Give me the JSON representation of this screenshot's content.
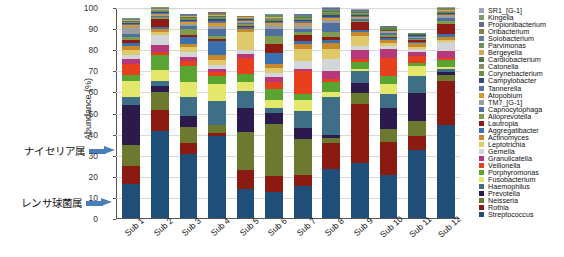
{
  "chart_data": {
    "type": "bar",
    "stacked": true,
    "title": "",
    "xlabel": "",
    "ylabel": "Abundance (%)",
    "ylim": [
      0,
      100
    ],
    "yticks": [
      0,
      10,
      20,
      30,
      40,
      50,
      60,
      70,
      80,
      90,
      100
    ],
    "grid": true,
    "legend_position": "right",
    "categories": [
      "Sub 1",
      "Sub 2",
      "Sub 3",
      "Sub 4",
      "Sub 5",
      "Sub 6",
      "Sub 7",
      "Sub 8",
      "Sub 9",
      "Sub 10",
      "Sub 11",
      "Sub 12"
    ],
    "totals": [
      95,
      100,
      97,
      98,
      96,
      97,
      97,
      100,
      99,
      91,
      88,
      100
    ],
    "series": [
      {
        "name": "Streptococcus",
        "color": "#1f4e79",
        "values": [
          16.0,
          43.5,
          30.0,
          36.0,
          14.0,
          11.0,
          14.5,
          22.0,
          28.0,
          21.0,
          36.5,
          44.0
        ]
      },
      {
        "name": "Rothia",
        "color": "#8b1a12",
        "values": [
          8.5,
          10.5,
          5.5,
          1.5,
          9.5,
          7.0,
          5.0,
          11.5,
          30.5,
          16.5,
          8.0,
          20.5
        ]
      },
      {
        "name": "Neisseria",
        "color": "#6b7a2e",
        "values": [
          10.0,
          9.0,
          7.5,
          3.5,
          18.0,
          22.0,
          16.0,
          2.5,
          5.5,
          6.5,
          8.0,
          3.0
        ]
      },
      {
        "name": "Prevotella",
        "color": "#2c1a4d",
        "values": [
          19.0,
          3.0,
          5.0,
          0.0,
          12.0,
          5.0,
          5.0,
          1.5,
          5.5,
          10.0,
          15.0,
          1.5
        ]
      },
      {
        "name": "Haemophilus",
        "color": "#3f6f86",
        "values": [
          4.0,
          2.5,
          9.0,
          10.5,
          8.0,
          2.0,
          8.0,
          17.0,
          6.0,
          7.0,
          9.0,
          1.5
        ]
      },
      {
        "name": "Fusobacterium",
        "color": "#e3e86a",
        "values": [
          7.5,
          5.5,
          7.0,
          7.5,
          4.5,
          3.5,
          5.0,
          2.0,
          1.0,
          5.0,
          5.5,
          0.8
        ]
      },
      {
        "name": "Porphyromonas",
        "color": "#59a432",
        "values": [
          3.0,
          7.5,
          7.5,
          3.5,
          4.0,
          4.5,
          2.5,
          4.5,
          3.5,
          4.0,
          1.5,
          3.5
        ]
      },
      {
        "name": "Veillonella",
        "color": "#e8401c",
        "values": [
          5.0,
          1.5,
          2.5,
          1.5,
          7.5,
          3.0,
          10.5,
          1.5,
          1.5,
          9.0,
          4.0,
          0.6
        ]
      },
      {
        "name": "Granulicatella",
        "color": "#b5397a",
        "values": [
          2.5,
          3.5,
          2.0,
          1.5,
          2.0,
          2.5,
          1.0,
          3.5,
          5.0,
          4.0,
          2.0,
          3.5
        ]
      },
      {
        "name": "Gemella",
        "color": "#d3d6d8",
        "values": [
          2.0,
          5.0,
          2.5,
          1.5,
          2.0,
          1.5,
          3.5,
          5.5,
          2.0,
          1.5,
          1.5,
          4.0
        ]
      },
      {
        "name": "Leptotrichia",
        "color": "#e0c96a",
        "values": [
          2.0,
          1.5,
          2.0,
          2.5,
          8.5,
          2.0,
          5.5,
          4.5,
          5.0,
          1.5,
          1.5,
          1.0
        ]
      },
      {
        "name": "Actinomyces",
        "color": "#c8892a",
        "values": [
          2.0,
          1.5,
          1.5,
          2.0,
          1.5,
          2.0,
          2.0,
          2.5,
          2.0,
          1.5,
          2.0,
          1.5
        ]
      },
      {
        "name": "Aggregatibacter",
        "color": "#3a6fb0",
        "values": [
          1.5,
          1.0,
          3.5,
          6.0,
          1.0,
          4.5,
          1.5,
          1.5,
          1.0,
          1.0,
          0.8,
          1.5
        ]
      },
      {
        "name": "Lautropia",
        "color": "#8e1c12",
        "values": [
          1.5,
          4.0,
          1.0,
          1.0,
          0.8,
          4.0,
          2.5,
          1.5,
          4.0,
          0.8,
          0.6,
          4.5
        ]
      },
      {
        "name": "Alloprevotella",
        "color": "#7f9b4e",
        "values": [
          1.5,
          1.0,
          2.5,
          1.5,
          0.8,
          3.5,
          1.5,
          2.0,
          0.8,
          0.8,
          0.6,
          1.5
        ]
      },
      {
        "name": "Capnocytophaga",
        "color": "#4f6f9e",
        "values": [
          1.2,
          0.8,
          1.5,
          3.0,
          0.6,
          3.0,
          1.5,
          4.0,
          0.8,
          0.8,
          0.6,
          1.5
        ]
      },
      {
        "name": "TM7_[G-1]",
        "color": "#9d9d9d",
        "values": [
          3.5,
          0.6,
          1.0,
          1.5,
          0.5,
          1.5,
          1.5,
          1.5,
          0.8,
          0.6,
          0.5,
          0.8
        ]
      },
      {
        "name": "Atopobium",
        "color": "#d99a2b",
        "values": [
          0.6,
          0.5,
          0.8,
          1.0,
          0.4,
          0.8,
          1.0,
          0.8,
          0.6,
          0.4,
          0.4,
          0.6
        ]
      },
      {
        "name": "Tannerella",
        "color": "#5b6fa8",
        "values": [
          0.5,
          0.5,
          0.6,
          1.0,
          0.4,
          0.6,
          0.8,
          0.8,
          0.5,
          0.4,
          0.3,
          0.6
        ]
      },
      {
        "name": "Campylobacter",
        "color": "#2f4f7a",
        "values": [
          0.5,
          0.4,
          0.6,
          0.8,
          0.3,
          0.6,
          0.6,
          0.8,
          0.5,
          0.3,
          0.3,
          0.5
        ]
      },
      {
        "name": "Corynebacterium",
        "color": "#6f8f3f",
        "values": [
          0.4,
          0.4,
          0.5,
          0.6,
          0.3,
          0.5,
          0.5,
          0.6,
          0.4,
          0.3,
          0.3,
          0.4
        ]
      },
      {
        "name": "Catonella",
        "color": "#8a8f6a",
        "values": [
          0.4,
          0.3,
          0.4,
          0.5,
          0.3,
          0.4,
          0.4,
          0.5,
          0.4,
          0.3,
          0.2,
          0.4
        ]
      },
      {
        "name": "Cardiobacterium",
        "color": "#4a7a4a",
        "values": [
          0.3,
          0.3,
          0.4,
          0.4,
          0.2,
          0.4,
          0.4,
          0.4,
          0.3,
          0.2,
          0.2,
          0.3
        ]
      },
      {
        "name": "Bergeyella",
        "color": "#d4a95a",
        "values": [
          0.3,
          0.3,
          0.3,
          0.4,
          0.2,
          0.3,
          0.3,
          0.4,
          0.3,
          0.2,
          0.2,
          0.3
        ]
      },
      {
        "name": "Parvimonas",
        "color": "#6a8f5a",
        "values": [
          0.3,
          0.2,
          0.3,
          0.3,
          0.2,
          0.3,
          0.3,
          0.3,
          0.3,
          0.2,
          0.2,
          0.3
        ]
      },
      {
        "name": "Solobacterium",
        "color": "#5f7fa5",
        "values": [
          0.2,
          0.2,
          0.3,
          0.3,
          0.2,
          0.3,
          0.3,
          0.3,
          0.2,
          0.2,
          0.1,
          0.2
        ]
      },
      {
        "name": "Oribacterium",
        "color": "#8e7a4a",
        "values": [
          0.2,
          0.2,
          0.2,
          0.3,
          0.2,
          0.2,
          0.2,
          0.3,
          0.2,
          0.2,
          0.1,
          0.2
        ]
      },
      {
        "name": "Propionibacterium",
        "color": "#6a6a8f",
        "values": [
          0.2,
          0.2,
          0.2,
          0.2,
          0.1,
          0.2,
          0.2,
          0.2,
          0.2,
          0.1,
          0.1,
          0.2
        ]
      },
      {
        "name": "Kingella",
        "color": "#7a9a6a",
        "values": [
          0.2,
          0.1,
          0.2,
          0.2,
          0.1,
          0.2,
          0.2,
          0.2,
          0.2,
          0.1,
          0.1,
          0.2
        ]
      },
      {
        "name": "SR1_[G-1]",
        "color": "#9aa6b5",
        "values": [
          0.2,
          0.1,
          0.2,
          0.2,
          0.1,
          0.2,
          0.2,
          0.2,
          0.2,
          0.1,
          0.1,
          0.2
        ]
      }
    ]
  },
  "legend": {
    "items": [
      {
        "label": "SR1_[G-1]",
        "color": "#9aa6b5"
      },
      {
        "label": "Kingella",
        "color": "#7a9a6a"
      },
      {
        "label": "Propionibacterium",
        "color": "#6a6a8f"
      },
      {
        "label": "Oribacterium",
        "color": "#8e7a4a"
      },
      {
        "label": "Solobacterium",
        "color": "#5f7fa5"
      },
      {
        "label": "Parvimonas",
        "color": "#6a8f5a"
      },
      {
        "label": "Bergeyella",
        "color": "#d4a95a"
      },
      {
        "label": "Cardiobacterium",
        "color": "#4a7a4a"
      },
      {
        "label": "Catonella",
        "color": "#8a8f6a"
      },
      {
        "label": "Corynebacterium",
        "color": "#6f8f3f"
      },
      {
        "label": "Campylobacter",
        "color": "#2f4f7a"
      },
      {
        "label": "Tannerella",
        "color": "#5b6fa8"
      },
      {
        "label": "Atopobium",
        "color": "#d99a2b"
      },
      {
        "label": "TM7_[G-1]",
        "color": "#9d9d9d"
      },
      {
        "label": "Capnocytophaga",
        "color": "#4f6f9e"
      },
      {
        "label": "Alloprevotella",
        "color": "#7f9b4e"
      },
      {
        "label": "Lautropia",
        "color": "#8e1c12"
      },
      {
        "label": "Aggregatibacter",
        "color": "#3a6fb0"
      },
      {
        "label": "Actinomyces",
        "color": "#c8892a"
      },
      {
        "label": "Leptotrichia",
        "color": "#e0c96a"
      },
      {
        "label": "Gemella",
        "color": "#d3d6d8"
      },
      {
        "label": "Granulicatella",
        "color": "#b5397a"
      },
      {
        "label": "Veillonella",
        "color": "#e8401c"
      },
      {
        "label": "Porphyromonas",
        "color": "#59a432"
      },
      {
        "label": "Fusobacterium",
        "color": "#e3e86a"
      },
      {
        "label": "Haemophilus",
        "color": "#3f6f86"
      },
      {
        "label": "Prevotella",
        "color": "#2c1a4d"
      },
      {
        "label": "Neisseria",
        "color": "#6b7a2e"
      },
      {
        "label": "Rothia",
        "color": "#8b1a12"
      },
      {
        "label": "Streptococcus",
        "color": "#1f4e79"
      }
    ]
  },
  "annotations": [
    {
      "text": "ナイセリア属",
      "arrow_color": "#4a7ebb",
      "points_to": "Neisseria"
    },
    {
      "text": "レンサ球菌属",
      "arrow_color": "#4a7ebb",
      "points_to": "Streptococcus"
    }
  ]
}
